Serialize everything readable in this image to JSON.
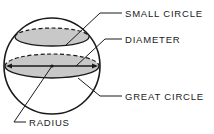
{
  "diagram": {
    "type": "sphere-geometry",
    "colors": {
      "stroke": "#1a1a1a",
      "fill": "#c8c8c8",
      "background": "#ffffff"
    },
    "labels": {
      "small_circle": "SMALL CIRCLE",
      "diameter": "DIAMETER",
      "great_circle": "GREAT CIRCLE",
      "radius": "RADIUS"
    }
  }
}
